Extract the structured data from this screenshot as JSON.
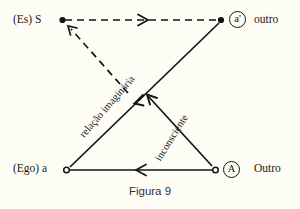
{
  "figure": {
    "caption": "Figura 9",
    "background_color": "#fdfdf6",
    "ink_color": "#15150f"
  },
  "nodes": [
    {
      "id": "es-s",
      "label": "(Es) S",
      "symbol": "",
      "marker": "filled-dot",
      "position": "top-left",
      "x": 62,
      "y": 20
    },
    {
      "id": "a-prime",
      "label": "outro",
      "symbol": "a'",
      "marker": "filled-dot",
      "position": "top-right",
      "x": 221,
      "y": 20
    },
    {
      "id": "ego-a",
      "label": "(Ego) a",
      "symbol": "",
      "marker": "open-dot",
      "position": "bottom-left",
      "x": 66,
      "y": 170
    },
    {
      "id": "big-A",
      "label": "Outro",
      "symbol": "A",
      "marker": "open-dot",
      "position": "bottom-right",
      "x": 215,
      "y": 170
    }
  ],
  "edges": [
    {
      "id": "s-to-a-prime",
      "style": "dashed",
      "from": "es-s",
      "to": "a-prime",
      "arrow": "mid-right",
      "label": ""
    },
    {
      "id": "crossing-to-s",
      "style": "dashed",
      "from": "crossing",
      "to": "es-s",
      "arrow": "head-at-s",
      "label": ""
    },
    {
      "id": "a-prime-to-ego-a",
      "style": "solid",
      "from": "a-prime",
      "to": "ego-a",
      "arrow": "mid-down-left",
      "label": "relação imaginária"
    },
    {
      "id": "big-A-to-s",
      "style": "solid",
      "from": "big-A",
      "to": "crossing",
      "arrow": "head-up-left",
      "label": "inconsciente"
    },
    {
      "id": "big-A-to-ego-a",
      "style": "solid",
      "from": "big-A",
      "to": "ego-a",
      "arrow": "mid-left",
      "label": ""
    }
  ],
  "path_labels": {
    "relacao_imaginaria": "relação imaginária",
    "inconsciente": "inconsciente"
  },
  "symbols": {
    "a_prime": "a'",
    "big_A": "A"
  }
}
